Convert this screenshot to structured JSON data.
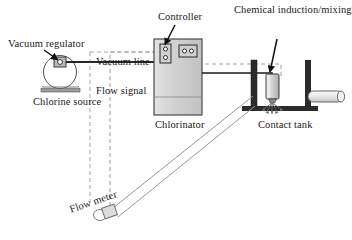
{
  "diagram": {
    "background_color": "#ffffff",
    "line_color": "#1a1a1a",
    "fill_light": "#d9d9d9",
    "fill_mid": "#bfbfbf",
    "fill_dark": "#2b2b2b",
    "labels": {
      "vacuum_regulator": "Vacuum regulator",
      "chlorine_source": "Chlorine source",
      "vacuum_line": "Vacuum line",
      "flow_signal": "Flow signal",
      "controller": "Controller",
      "chlorinator": "Chlorinator",
      "chemical_unit": "Chemical induction/mixing unit",
      "contact_tank": "Contact tank",
      "flow_meter": "Flow meter"
    },
    "components": [
      {
        "name": "chlorine-source-cylinder",
        "shape": "circle",
        "cx": 60,
        "cy": 72,
        "r": 16
      },
      {
        "name": "vacuum-regulator-valve",
        "shape": "rect",
        "x": 54,
        "y": 57,
        "w": 12,
        "h": 10
      },
      {
        "name": "chlorine-source-base",
        "shape": "rect",
        "x": 41,
        "y": 89,
        "w": 39,
        "h": 4
      },
      {
        "name": "chlorinator-cabinet",
        "shape": "rect",
        "x": 154,
        "y": 39,
        "w": 48,
        "h": 76
      },
      {
        "name": "controller-panel-vertical",
        "shape": "rect",
        "x": 160,
        "y": 44,
        "w": 11,
        "h": 19
      },
      {
        "name": "controller-panel-horizontal",
        "shape": "rect",
        "x": 179,
        "y": 45,
        "w": 17,
        "h": 12
      },
      {
        "name": "contact-tank-wall-left",
        "shape": "rect",
        "x": 251,
        "y": 60,
        "w": 6,
        "h": 46
      },
      {
        "name": "contact-tank-wall-right",
        "shape": "rect",
        "x": 305,
        "y": 60,
        "w": 6,
        "h": 46
      },
      {
        "name": "contact-tank-floor",
        "shape": "rect",
        "x": 242,
        "y": 106,
        "w": 76,
        "h": 5
      },
      {
        "name": "mixing-unit-body",
        "shape": "rect",
        "x": 266,
        "y": 74,
        "w": 13,
        "h": 25
      },
      {
        "name": "outlet-pipe",
        "shape": "pipe",
        "x": 311,
        "y": 92,
        "w": 34,
        "h": 11
      },
      {
        "name": "flow-meter-body",
        "shape": "rect",
        "x": 104,
        "y": 208,
        "w": 13,
        "h": 10
      },
      {
        "name": "flow-meter-end-cap",
        "shape": "ellipse",
        "cx": 99,
        "cy": 214,
        "rx": 6,
        "ry": 5
      }
    ],
    "connections": [
      {
        "name": "vacuum-line-run",
        "style": "solid",
        "from": "vacuum-regulator",
        "to": "chlorinator"
      },
      {
        "name": "chlorinator-to-mixing-unit",
        "style": "solid",
        "from": "chlorinator",
        "to": "mixing-unit"
      },
      {
        "name": "flow-signal-run",
        "style": "dashed",
        "from": "flow-meter",
        "to": "controller"
      },
      {
        "name": "controller-to-mixing-signal",
        "style": "dashed",
        "from": "controller",
        "to": "mixing-unit"
      },
      {
        "name": "process-water-pipe",
        "style": "solid-double",
        "from": "flow-meter",
        "to": "contact-tank"
      }
    ],
    "leader_lines": [
      {
        "name": "leader-vacuum-regulator",
        "style": "arrow"
      },
      {
        "name": "leader-controller",
        "style": "arrow"
      },
      {
        "name": "leader-chemical-unit",
        "style": "arrow"
      }
    ]
  }
}
